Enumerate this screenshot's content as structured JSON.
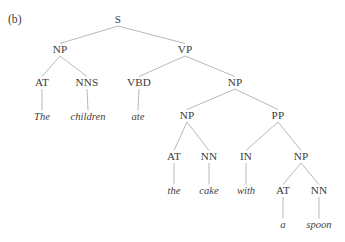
{
  "figure": {
    "panel_label": "(b)",
    "panel_label_pos": {
      "x": 8,
      "y": 14
    },
    "width": 345,
    "height": 242,
    "background_color": "#ffffff",
    "edge_color": "#9a9a9a",
    "text_color": "#3b3b3b",
    "sentence": "The children ate the cake with a spoon"
  },
  "tree": {
    "nodes": [
      {
        "id": "s",
        "label": "S",
        "x": 118,
        "y": 20,
        "kind": "nonterminal"
      },
      {
        "id": "np1",
        "label": "NP",
        "x": 60,
        "y": 50,
        "kind": "nonterminal"
      },
      {
        "id": "vp",
        "label": "VP",
        "x": 185,
        "y": 50,
        "kind": "nonterminal"
      },
      {
        "id": "at1",
        "label": "AT",
        "x": 42,
        "y": 83,
        "kind": "nonterminal"
      },
      {
        "id": "nns",
        "label": "NNS",
        "x": 87,
        "y": 83,
        "kind": "nonterminal"
      },
      {
        "id": "vbd",
        "label": "VBD",
        "x": 139,
        "y": 83,
        "kind": "nonterminal"
      },
      {
        "id": "np2",
        "label": "NP",
        "x": 235,
        "y": 83,
        "kind": "nonterminal"
      },
      {
        "id": "w_the1",
        "label": "The",
        "x": 42,
        "y": 117,
        "kind": "terminal"
      },
      {
        "id": "w_child",
        "label": "children",
        "x": 88,
        "y": 117,
        "kind": "terminal"
      },
      {
        "id": "w_ate",
        "label": "ate",
        "x": 138,
        "y": 117,
        "kind": "terminal"
      },
      {
        "id": "np3",
        "label": "NP",
        "x": 187,
        "y": 116,
        "kind": "nonterminal"
      },
      {
        "id": "pp",
        "label": "PP",
        "x": 278,
        "y": 116,
        "kind": "nonterminal"
      },
      {
        "id": "at2",
        "label": "AT",
        "x": 174,
        "y": 157,
        "kind": "nonterminal"
      },
      {
        "id": "nn1",
        "label": "NN",
        "x": 209,
        "y": 157,
        "kind": "nonterminal"
      },
      {
        "id": "in",
        "label": "IN",
        "x": 246,
        "y": 157,
        "kind": "nonterminal"
      },
      {
        "id": "np4",
        "label": "NP",
        "x": 301,
        "y": 157,
        "kind": "nonterminal"
      },
      {
        "id": "w_the2",
        "label": "the",
        "x": 174,
        "y": 191,
        "kind": "terminal"
      },
      {
        "id": "w_cake",
        "label": "cake",
        "x": 209,
        "y": 191,
        "kind": "terminal"
      },
      {
        "id": "w_with",
        "label": "with",
        "x": 246,
        "y": 191,
        "kind": "terminal"
      },
      {
        "id": "at3",
        "label": "AT",
        "x": 283,
        "y": 191,
        "kind": "nonterminal"
      },
      {
        "id": "nn2",
        "label": "NN",
        "x": 319,
        "y": 191,
        "kind": "nonterminal"
      },
      {
        "id": "w_a",
        "label": "a",
        "x": 283,
        "y": 225,
        "kind": "terminal"
      },
      {
        "id": "w_spoon",
        "label": "spoon",
        "x": 319,
        "y": 225,
        "kind": "terminal"
      }
    ],
    "edges": [
      {
        "from": "s",
        "to": "np1"
      },
      {
        "from": "s",
        "to": "vp"
      },
      {
        "from": "np1",
        "to": "at1"
      },
      {
        "from": "np1",
        "to": "nns"
      },
      {
        "from": "vp",
        "to": "vbd"
      },
      {
        "from": "vp",
        "to": "np2"
      },
      {
        "from": "at1",
        "to": "w_the1"
      },
      {
        "from": "nns",
        "to": "w_child"
      },
      {
        "from": "vbd",
        "to": "w_ate"
      },
      {
        "from": "np2",
        "to": "np3"
      },
      {
        "from": "np2",
        "to": "pp"
      },
      {
        "from": "np3",
        "to": "at2"
      },
      {
        "from": "np3",
        "to": "nn1"
      },
      {
        "from": "pp",
        "to": "in"
      },
      {
        "from": "pp",
        "to": "np4"
      },
      {
        "from": "at2",
        "to": "w_the2"
      },
      {
        "from": "nn1",
        "to": "w_cake"
      },
      {
        "from": "in",
        "to": "w_with"
      },
      {
        "from": "np4",
        "to": "at3"
      },
      {
        "from": "np4",
        "to": "nn2"
      },
      {
        "from": "at3",
        "to": "w_a"
      },
      {
        "from": "nn2",
        "to": "w_spoon"
      }
    ]
  }
}
